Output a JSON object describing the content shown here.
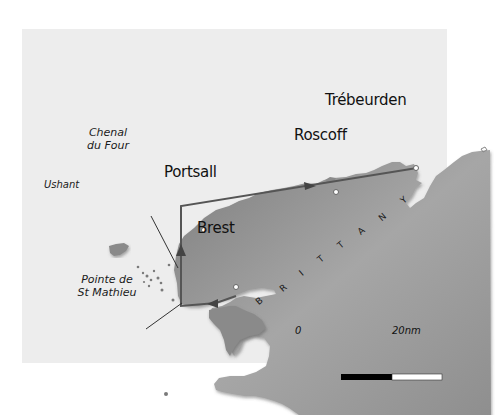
{
  "map": {
    "region_label": "BRITTANY",
    "region_letters": [
      "B",
      "R",
      "I",
      "T",
      "T",
      "A",
      "N",
      "Y"
    ],
    "colors": {
      "sea": "#ededed",
      "land": "#8c8c8c",
      "land_light": "#a3a3a3",
      "route": "#555555",
      "text": "#111111"
    },
    "places": [
      {
        "id": "trebeurden",
        "name": "Trébeurden"
      },
      {
        "id": "roscoff",
        "name": "Roscoff"
      },
      {
        "id": "portsall",
        "name": "Portsall"
      },
      {
        "id": "brest",
        "name": "Brest"
      }
    ],
    "annotations": {
      "chenal_line1": "Chenal",
      "chenal_line2": "du Four",
      "ushant": "Ushant",
      "pointe_line1": "Pointe de",
      "pointe_line2": "St Mathieu"
    },
    "scale_bar": {
      "start_label": "0",
      "end_label": "20nm"
    }
  }
}
